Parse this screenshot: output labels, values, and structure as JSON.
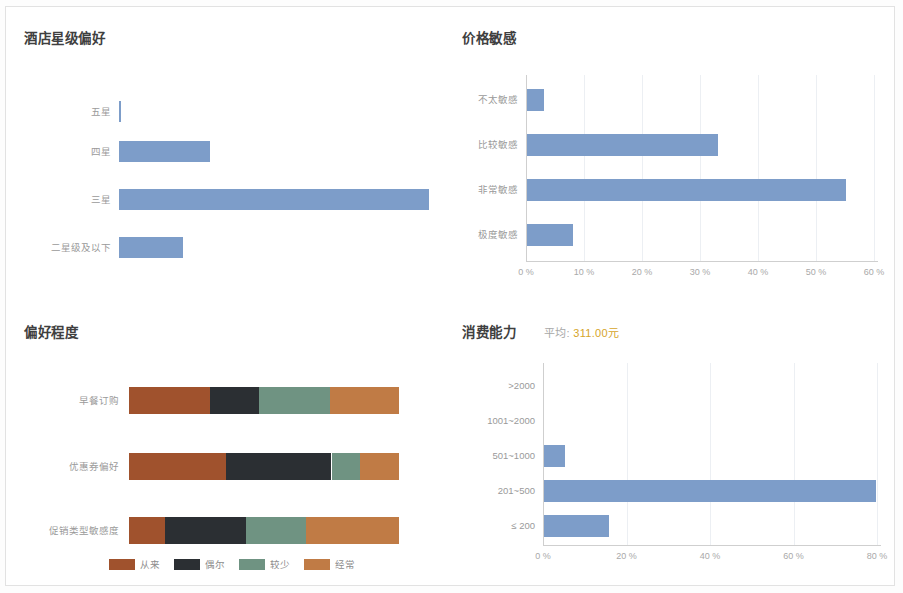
{
  "colors": {
    "bar_blue": "#7d9dc9",
    "never": "#a0522d",
    "sometimes": "#2b2f33",
    "seldom": "#6f9382",
    "often": "#c07b45",
    "accent_amount": "#d6a52a",
    "axis": "#cfcfcf",
    "grid": "#eceff3",
    "label": "#9a9a9a",
    "title": "#3f3f3f",
    "card_border": "#e2e2e2"
  },
  "panels": {
    "hotel_star": {
      "title": "酒店星级偏好"
    },
    "price_sensitivity": {
      "title": "价格敏感"
    },
    "preference_degree": {
      "title": "偏好程度"
    },
    "spending_power": {
      "title": "消费能力",
      "average_label": "平均:",
      "average_value": "311.00",
      "average_unit": "元"
    }
  },
  "chart_data": [
    {
      "id": "hotel_star",
      "type": "bar",
      "orientation": "horizontal",
      "title": "酒店星级偏好",
      "categories": [
        "五星",
        "四星",
        "三星",
        "二星级及以下"
      ],
      "values": [
        0.3,
        29.2,
        100.0,
        20.5
      ],
      "unit": "%",
      "xlabel": "",
      "ylabel": "",
      "xlim": [
        0,
        100
      ],
      "ticks": [],
      "grid": false,
      "legend": "none",
      "series_color": "#7d9dc9"
    },
    {
      "id": "price_sensitivity",
      "type": "bar",
      "orientation": "horizontal",
      "title": "价格敏感",
      "categories": [
        "不太敏感",
        "比较敏感",
        "非常敏感",
        "极度敏感"
      ],
      "values": [
        3.0,
        33.0,
        55.0,
        8.0
      ],
      "unit": "%",
      "xlabel": "",
      "ylabel": "",
      "xlim": [
        0,
        60
      ],
      "ticks": [
        "0 %",
        "10 %",
        "20 %",
        "30 %",
        "40 %",
        "50 %",
        "60 %"
      ],
      "tick_values": [
        0,
        10,
        20,
        30,
        40,
        50,
        60
      ],
      "grid": true,
      "legend": "none",
      "series_color": "#7d9dc9"
    },
    {
      "id": "preference_degree",
      "type": "bar",
      "orientation": "horizontal",
      "stacked": true,
      "normalized": true,
      "title": "偏好程度",
      "categories": [
        "早餐订购",
        "优惠券偏好",
        "促销类型敏感度"
      ],
      "series": [
        {
          "name": "从来",
          "color": "#a0522d",
          "values": [
            30.0,
            36.0,
            13.5
          ]
        },
        {
          "name": "偶尔",
          "color": "#2b2f33",
          "values": [
            18.0,
            39.0,
            30.0
          ]
        },
        {
          "name": "较少",
          "color": "#6f9382",
          "values": [
            26.5,
            10.5,
            22.0
          ]
        },
        {
          "name": "经常",
          "color": "#c07b45",
          "values": [
            25.5,
            14.5,
            34.5
          ]
        }
      ],
      "unit": "%",
      "xlabel": "",
      "ylabel": "",
      "xlim": [
        0,
        100
      ],
      "ticks": [],
      "grid": false,
      "legend": "bottom-center"
    },
    {
      "id": "spending_power",
      "type": "bar",
      "orientation": "horizontal",
      "title": "消费能力",
      "subtitle": "平均: 311.00元",
      "categories": [
        ">2000",
        "1001~2000",
        "501~1000",
        "201~500",
        "≤ 200"
      ],
      "values": [
        0.0,
        0.0,
        5.0,
        79.5,
        15.5
      ],
      "unit": "%",
      "xlabel": "",
      "ylabel": "",
      "xlim": [
        0,
        80
      ],
      "ticks": [
        "0 %",
        "20 %",
        "40 %",
        "60 %",
        "80 %"
      ],
      "tick_values": [
        0,
        20,
        40,
        60,
        80
      ],
      "grid": true,
      "legend": "none",
      "series_color": "#7d9dc9"
    }
  ]
}
